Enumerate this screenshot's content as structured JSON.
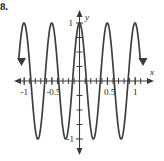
{
  "problem": {
    "number": "8."
  },
  "chart_data": {
    "type": "line",
    "title": "",
    "subtitle": "",
    "xlabel": "x",
    "ylabel": "y",
    "function": "y = cos(4πx)",
    "amplitude": 1,
    "period": 0.5,
    "xlim": [
      -1.2,
      1.2
    ],
    "ylim": [
      -1.25,
      1.25
    ],
    "grid": false,
    "legend": false,
    "legend_position": "none",
    "x_tick_labels": [
      "-1",
      "-0.5",
      "0.5",
      "1"
    ],
    "x_tick_values": [
      -1,
      -0.5,
      0.5,
      1
    ],
    "x_minor_tick_values": [
      -1.1,
      -0.9,
      -0.8,
      -0.7,
      -0.6,
      -0.4,
      -0.3,
      -0.2,
      -0.1,
      0.1,
      0.2,
      0.3,
      0.4,
      0.6,
      0.7,
      0.8,
      0.9,
      1.1
    ],
    "y_tick_labels": [
      "1",
      "-1"
    ],
    "y_tick_values": [
      1,
      -1
    ],
    "y_minor_tick_values": [
      0.75,
      0.5,
      0.25,
      -0.25,
      -0.5,
      -0.75
    ],
    "x_axis_arrows": [
      "left",
      "right"
    ],
    "y_axis_arrows": [
      "up",
      "down"
    ],
    "curve_end_arrows": [
      "left-down",
      "right-down"
    ],
    "peaks_x": [
      -1,
      -0.5,
      0,
      0.5,
      1
    ],
    "peaks_y": [
      1,
      1,
      1,
      1,
      1
    ],
    "troughs_x": [
      -0.75,
      -0.25,
      0.25,
      0.75
    ],
    "troughs_y": [
      -1,
      -1,
      -1,
      -1
    ],
    "series": [
      {
        "name": "y = cos(4πx)",
        "x": [
          -1.12,
          -1.08,
          -1.04,
          -1.0,
          -0.96,
          -0.92,
          -0.88,
          -0.84,
          -0.8,
          -0.76,
          -0.72,
          -0.68,
          -0.64,
          -0.6,
          -0.56,
          -0.52,
          -0.48,
          -0.44,
          -0.4,
          -0.36,
          -0.32,
          -0.28,
          -0.24,
          -0.2,
          -0.16,
          -0.12,
          -0.08,
          -0.04,
          0.0,
          0.04,
          0.08,
          0.12,
          0.16,
          0.2,
          0.24,
          0.28,
          0.32,
          0.36,
          0.4,
          0.44,
          0.48,
          0.52,
          0.56,
          0.6,
          0.64,
          0.68,
          0.72,
          0.76,
          0.8,
          0.84,
          0.88,
          0.92,
          0.96,
          1.0,
          1.04,
          1.08,
          1.12
        ],
        "y": [
          -0.64,
          -0.0,
          0.64,
          1.0,
          0.64,
          -0.0,
          -0.64,
          -1.0,
          -0.64,
          0.0,
          0.64,
          1.0,
          0.64,
          0.0,
          -0.64,
          -1.0,
          -0.64,
          0.0,
          0.64,
          1.0,
          0.64,
          -0.0,
          -0.64,
          -1.0,
          -0.64,
          0.0,
          0.64,
          1.0,
          1.0,
          1.0,
          0.64,
          0.0,
          -0.64,
          -1.0,
          -0.64,
          0.0,
          0.64,
          1.0,
          0.64,
          -0.0,
          -0.64,
          -1.0,
          -0.64,
          0.0,
          0.64,
          1.0,
          0.64,
          -1.0,
          -0.64,
          0.0,
          0.64,
          1.0,
          0.64,
          1.0,
          0.64,
          -0.0,
          -0.64
        ]
      }
    ]
  }
}
